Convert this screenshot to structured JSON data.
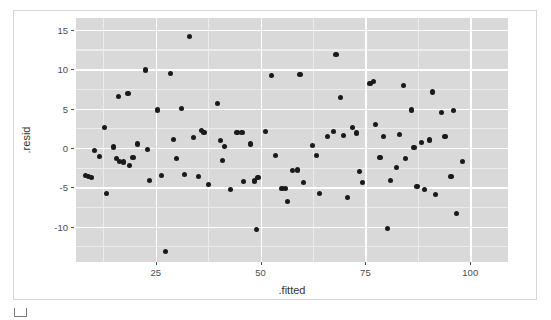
{
  "figure": {
    "background_color": "#ffffff",
    "frame_color": "#d6d6d6",
    "panel_color": "#d9d9d9",
    "gridline_color": "#ffffff",
    "point_color": "#1a1a1a"
  },
  "axes": {
    "x_title": ".fitted",
    "y_title": ".resid",
    "x_ticks": [
      "25",
      "50",
      "75",
      "100"
    ],
    "y_ticks": [
      "15",
      "10",
      "5",
      "0",
      "-5",
      "-10"
    ]
  },
  "caption": {
    "label": "",
    "swatch_icon": "square-outline-icon"
  },
  "chart_data": {
    "type": "scatter",
    "title": "",
    "xlabel": ".fitted",
    "ylabel": ".resid",
    "xlim": [
      6,
      109
    ],
    "ylim": [
      -14.5,
      16.5
    ],
    "x_ticks": [
      25,
      50,
      75,
      100
    ],
    "y_ticks": [
      -10,
      -5,
      0,
      5,
      10,
      15
    ],
    "grid": true,
    "legend": null,
    "marker": {
      "shape": "circle",
      "color": "#1a1a1a",
      "size": 5
    },
    "points": [
      [
        8.2,
        -3.5
      ],
      [
        9.0,
        -3.6
      ],
      [
        9.6,
        -3.8
      ],
      [
        10.4,
        -0.3
      ],
      [
        11.6,
        -1.1
      ],
      [
        12.8,
        2.6
      ],
      [
        13.2,
        -5.8
      ],
      [
        14.9,
        0.1
      ],
      [
        15.6,
        -1.3
      ],
      [
        16.3,
        -1.7
      ],
      [
        16.1,
        6.5
      ],
      [
        17.3,
        -1.8
      ],
      [
        18.4,
        6.9
      ],
      [
        18.8,
        -2.2
      ],
      [
        19.6,
        -1.2
      ],
      [
        20.6,
        0.5
      ],
      [
        22.5,
        9.9
      ],
      [
        23.1,
        -0.2
      ],
      [
        23.5,
        -4.1
      ],
      [
        25.4,
        4.8
      ],
      [
        26.3,
        -3.5
      ],
      [
        27.4,
        -13.2
      ],
      [
        28.6,
        9.4
      ],
      [
        29.3,
        1.1
      ],
      [
        29.9,
        -1.3
      ],
      [
        31.2,
        5.0
      ],
      [
        31.8,
        -3.4
      ],
      [
        33.0,
        14.2
      ],
      [
        34.0,
        1.3
      ],
      [
        35.2,
        -3.6
      ],
      [
        36.0,
        2.2
      ],
      [
        36.5,
        2.0
      ],
      [
        37.6,
        -4.7
      ],
      [
        39.8,
        5.6
      ],
      [
        40.4,
        0.9
      ],
      [
        40.9,
        -1.6
      ],
      [
        41.5,
        0.2
      ],
      [
        42.9,
        -5.3
      ],
      [
        44.4,
        2.0
      ],
      [
        45.6,
        2.0
      ],
      [
        46.0,
        -4.3
      ],
      [
        47.6,
        0.5
      ],
      [
        48.6,
        -4.2
      ],
      [
        49.4,
        -3.8
      ],
      [
        49.0,
        -10.4
      ],
      [
        51.2,
        2.1
      ],
      [
        52.6,
        9.2
      ],
      [
        53.6,
        -1.0
      ],
      [
        55.1,
        -5.2
      ],
      [
        55.9,
        -5.2
      ],
      [
        56.4,
        -6.8
      ],
      [
        57.6,
        -2.9
      ],
      [
        58.9,
        -2.8
      ],
      [
        59.4,
        9.3
      ],
      [
        60.3,
        -4.4
      ],
      [
        62.3,
        0.3
      ],
      [
        63.4,
        -1.0
      ],
      [
        64.0,
        -5.8
      ],
      [
        66.0,
        1.4
      ],
      [
        67.3,
        2.1
      ],
      [
        68.0,
        11.9
      ],
      [
        69.1,
        6.4
      ],
      [
        69.8,
        1.6
      ],
      [
        70.7,
        -6.3
      ],
      [
        72.0,
        2.6
      ],
      [
        72.8,
        1.9
      ],
      [
        73.6,
        -3.0
      ],
      [
        74.3,
        -4.4
      ],
      [
        76.1,
        8.2
      ],
      [
        77.0,
        8.4
      ],
      [
        77.5,
        3.0
      ],
      [
        78.5,
        -1.2
      ],
      [
        79.3,
        1.4
      ],
      [
        80.2,
        -10.2
      ],
      [
        80.9,
        -4.1
      ],
      [
        82.4,
        -2.5
      ],
      [
        83.2,
        1.7
      ],
      [
        84.0,
        7.9
      ],
      [
        84.6,
        -1.4
      ],
      [
        85.9,
        4.8
      ],
      [
        86.6,
        0.0
      ],
      [
        87.3,
        -4.9
      ],
      [
        88.3,
        0.7
      ],
      [
        89.0,
        -5.3
      ],
      [
        90.2,
        1.0
      ],
      [
        91.0,
        7.1
      ],
      [
        91.8,
        -5.9
      ],
      [
        93.1,
        4.5
      ],
      [
        94.0,
        1.4
      ],
      [
        95.4,
        -3.6
      ],
      [
        96.0,
        4.7
      ],
      [
        96.8,
        -8.3
      ],
      [
        98.2,
        -1.7
      ]
    ]
  }
}
